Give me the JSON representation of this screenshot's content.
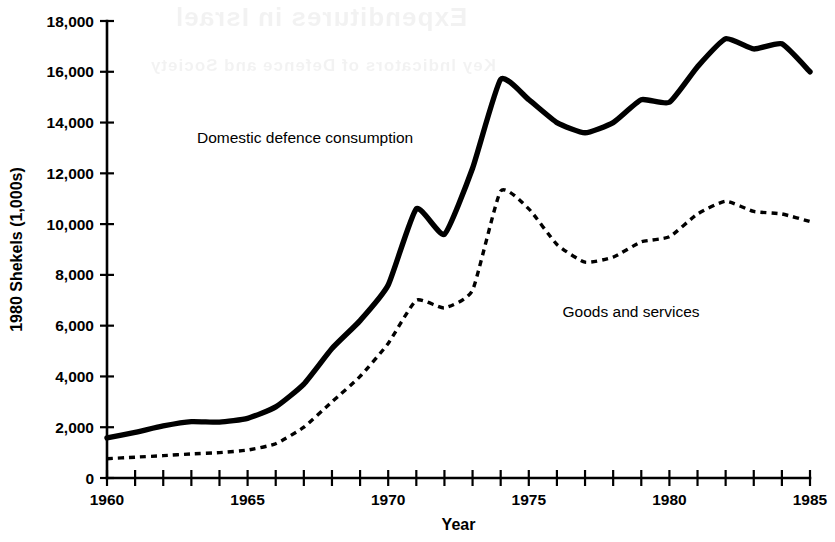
{
  "figure": {
    "background_color": "#ffffff",
    "ink_color": "#000000",
    "bleed_through_text": {
      "line1": "Expenditures in Israel",
      "line2": "Key Indicators of Defence and Society"
    }
  },
  "chart_data": {
    "type": "line",
    "title": "",
    "subtitle": "",
    "xlabel": "Year",
    "ylabel": "1980 Shekels (1,000s)",
    "xlim": [
      1960,
      1985
    ],
    "ylim": [
      0,
      18000
    ],
    "grid": false,
    "legend_position": "inline-annotation",
    "x_tick_interval": 1,
    "x_label_interval": 5,
    "y_tick_interval": 2000,
    "xticks": [
      1960,
      1965,
      1970,
      1975,
      1980,
      1985
    ],
    "xtick_labels": [
      "1960",
      "1965",
      "1970",
      "1975",
      "1980",
      "1985"
    ],
    "xticks_minor": [
      1961,
      1962,
      1963,
      1964,
      1966,
      1967,
      1968,
      1969,
      1971,
      1972,
      1973,
      1974,
      1976,
      1977,
      1978,
      1979,
      1981,
      1982,
      1983,
      1984
    ],
    "yticks": [
      0,
      2000,
      4000,
      6000,
      8000,
      10000,
      12000,
      14000,
      16000,
      18000
    ],
    "ytick_labels": [
      "0",
      "2,000",
      "4,000",
      "6,000",
      "8,000",
      "10,000",
      "12,000",
      "14,000",
      "16,000",
      "18,000"
    ],
    "x": [
      1960,
      1961,
      1962,
      1963,
      1964,
      1965,
      1966,
      1967,
      1968,
      1969,
      1970,
      1971,
      1972,
      1973,
      1974,
      1975,
      1976,
      1977,
      1978,
      1979,
      1980,
      1981,
      1982,
      1983,
      1984,
      1985
    ],
    "series": [
      {
        "name": "Domestic defence consumption",
        "style": "solid",
        "line_width": 5.4,
        "label_x": 1963.2,
        "label_y": 13200,
        "values": [
          1580,
          1800,
          2050,
          2220,
          2200,
          2350,
          2800,
          3700,
          5100,
          6200,
          7600,
          10600,
          9600,
          12200,
          15700,
          14900,
          14000,
          13600,
          14000,
          14900,
          14800,
          16200,
          17300,
          16900,
          17100,
          16000
        ]
      },
      {
        "name": "Goods and services",
        "style": "dashed",
        "line_width": 3.4,
        "label_x": 1976.2,
        "label_y": 6350,
        "values": [
          760,
          820,
          880,
          950,
          1000,
          1100,
          1350,
          2000,
          3000,
          4000,
          5300,
          7000,
          6700,
          7400,
          11300,
          10600,
          9200,
          8500,
          8700,
          9300,
          9500,
          10400,
          10900,
          10500,
          10400,
          10100
        ]
      }
    ]
  }
}
